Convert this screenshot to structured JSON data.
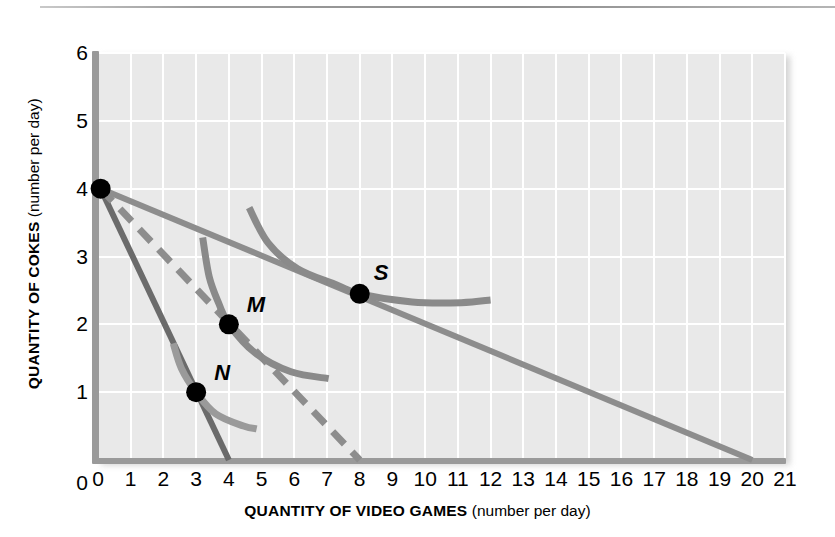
{
  "figure": {
    "kind": "economics-indifference-curve-diagram",
    "top_rule": true
  },
  "chart_data": {
    "type": "line",
    "title": "",
    "xlabel_bold": "QUANTITY OF VIDEO GAMES",
    "xlabel_paren": " (number per day)",
    "ylabel_bold": "QUANTITY OF COKES",
    "ylabel_paren": " (number per day)",
    "xlim": [
      0,
      21
    ],
    "ylim": [
      0,
      6
    ],
    "xticks": [
      0,
      1,
      2,
      3,
      4,
      5,
      6,
      7,
      8,
      9,
      10,
      11,
      12,
      13,
      14,
      15,
      16,
      17,
      18,
      19,
      20,
      21
    ],
    "yticks": [
      0,
      1,
      2,
      3,
      4,
      5,
      6
    ],
    "grid": true,
    "grid_color": "#ffffff",
    "plot_bg": "#e9e9e9",
    "legend": "none",
    "series": [
      {
        "name": "budget-line-steep",
        "style": "solid",
        "color": "#6b6b6b",
        "width": 6,
        "points": [
          [
            0.08,
            4.0
          ],
          [
            4.0,
            0.0
          ]
        ],
        "note": "steepest budget line, intercepts (0,4) and (4,0)"
      },
      {
        "name": "budget-line-dashed",
        "style": "dashed",
        "color": "#8d8d8d",
        "width": 7,
        "points": [
          [
            0.08,
            4.0
          ],
          [
            8.0,
            0.0
          ]
        ],
        "note": "dashed budget line, intercepts (0,4) and (8,0)"
      },
      {
        "name": "budget-line-shallow",
        "style": "solid",
        "color": "#8d8d8d",
        "width": 6,
        "points": [
          [
            0.08,
            4.0
          ],
          [
            20.0,
            0.0
          ]
        ],
        "note": "flattest budget line, intercepts (0,4) and (20,0)"
      },
      {
        "name": "indifference-curve-N",
        "style": "solid",
        "color": "#9a9a9a",
        "width": 7,
        "points": [
          [
            2.3,
            1.72
          ],
          [
            2.55,
            1.35
          ],
          [
            3.0,
            1.0
          ],
          [
            3.6,
            0.68
          ],
          [
            4.45,
            0.5
          ],
          [
            4.85,
            0.46
          ]
        ]
      },
      {
        "name": "indifference-curve-M",
        "style": "solid",
        "color": "#8a8a8a",
        "width": 7,
        "points": [
          [
            3.2,
            3.28
          ],
          [
            3.4,
            2.7
          ],
          [
            3.7,
            2.3
          ],
          [
            4.0,
            2.0
          ],
          [
            4.8,
            1.58
          ],
          [
            5.9,
            1.3
          ],
          [
            7.05,
            1.2
          ]
        ]
      },
      {
        "name": "indifference-curve-S",
        "style": "solid",
        "color": "#8a8a8a",
        "width": 7,
        "points": [
          [
            4.62,
            3.72
          ],
          [
            5.2,
            3.2
          ],
          [
            6.1,
            2.82
          ],
          [
            7.3,
            2.58
          ],
          [
            8.0,
            2.45
          ],
          [
            9.6,
            2.33
          ],
          [
            11.1,
            2.32
          ],
          [
            12.0,
            2.36
          ]
        ]
      }
    ],
    "points": [
      {
        "label": "N",
        "x": 3.0,
        "y": 1.0,
        "marker": "filled-circle",
        "color": "#000000",
        "label_dx": 18,
        "label_dy": -30
      },
      {
        "label": "M",
        "x": 4.0,
        "y": 2.0,
        "marker": "filled-circle",
        "color": "#000000",
        "label_dx": 18,
        "label_dy": -30
      },
      {
        "label": "S",
        "x": 8.0,
        "y": 2.45,
        "marker": "filled-circle",
        "color": "#000000",
        "label_dx": 14,
        "label_dy": -32
      }
    ]
  }
}
